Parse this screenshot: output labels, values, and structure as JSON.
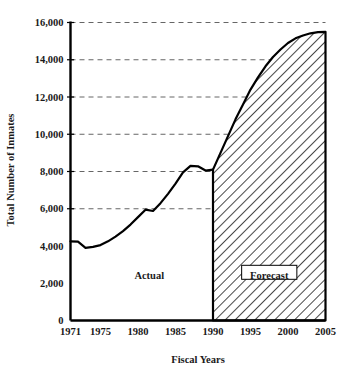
{
  "chart_data": {
    "type": "area",
    "title": "",
    "xlabel": "Fiscal Years",
    "ylabel": "Total Number of Inmates",
    "xlim": [
      1971,
      2005
    ],
    "ylim": [
      0,
      16000
    ],
    "grid": true,
    "grid_values": [
      16000,
      14000,
      12000,
      10000,
      8000,
      6000
    ],
    "y_ticks": [
      0,
      2000,
      4000,
      6000,
      8000,
      10000,
      12000,
      14000,
      16000
    ],
    "y_tick_labels": [
      "0",
      "2,000",
      "4,000",
      "6,000",
      "8,000",
      "10,000",
      "12,000",
      "14,000",
      "16,000"
    ],
    "x_ticks": [
      1971,
      1975,
      1980,
      1985,
      1990,
      1995,
      2000,
      2005
    ],
    "x_tick_labels": [
      "1971",
      "1975",
      "1980",
      "1985",
      "1990",
      "1995",
      "2000",
      "2005"
    ],
    "series": [
      {
        "name": "Actual",
        "style": "line",
        "x": [
          1971,
          1972,
          1973,
          1974,
          1975,
          1976,
          1977,
          1978,
          1979,
          1980,
          1981,
          1982,
          1983,
          1984,
          1985,
          1986,
          1987,
          1988,
          1989,
          1990
        ],
        "values": [
          4250,
          4230,
          3900,
          3950,
          4050,
          4250,
          4500,
          4800,
          5150,
          5550,
          5950,
          5880,
          6300,
          6800,
          7350,
          7950,
          8300,
          8280,
          8050,
          8100
        ]
      },
      {
        "name": "Forecast",
        "style": "hatched-area",
        "x": [
          1990,
          1991,
          1992,
          1993,
          1994,
          1995,
          1996,
          1997,
          1998,
          1999,
          2000,
          2001,
          2002,
          2003,
          2004,
          2005
        ],
        "values": [
          8100,
          9000,
          9900,
          10800,
          11600,
          12400,
          13050,
          13650,
          14150,
          14550,
          14900,
          15150,
          15300,
          15420,
          15480,
          15500
        ]
      }
    ],
    "annotations": [
      {
        "text": "Actual",
        "x": 1981.5,
        "y": 2400,
        "boxed": false
      },
      {
        "text": "Forecast",
        "x": 1997.5,
        "y": 2400,
        "boxed": true
      }
    ],
    "colors": {
      "line": "#000000",
      "axis": "#000000",
      "grid": "#666666",
      "hatch": "#1a1a1a",
      "background": "#ffffff"
    }
  }
}
